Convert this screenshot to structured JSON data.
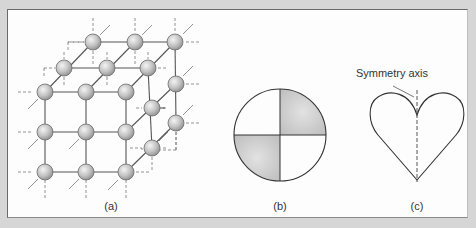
{
  "figure": {
    "panels": [
      {
        "id": "a",
        "label": "(a)",
        "description": "simple cubic crystal lattice of spherical atoms"
      },
      {
        "id": "b",
        "label": "(b)",
        "description": "circle divided into four quadrants, two opposite quadrants shaded"
      },
      {
        "id": "c",
        "label": "(c)",
        "description": "heart shape with vertical dashed symmetry axis",
        "annotation": "Symmetry axis"
      }
    ]
  },
  "colors": {
    "background": "#d6d6d6",
    "panel": "#fdfdfd",
    "line": "#444444",
    "atom_fill": "#c4c4c4",
    "shade": "#d0d0d0"
  }
}
